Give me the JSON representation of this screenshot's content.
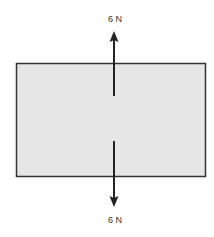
{
  "diagram": {
    "type": "free-body diagram",
    "box_fill": "#e6e6e6",
    "box_stroke": "#333333",
    "forces": [
      {
        "direction": "up",
        "label": "6 N"
      },
      {
        "direction": "down",
        "label": "6 N"
      }
    ]
  }
}
